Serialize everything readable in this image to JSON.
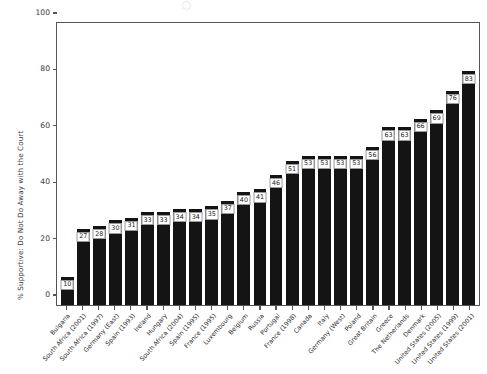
{
  "chart_data": {
    "type": "bar",
    "title": "",
    "subtitle": "",
    "xlabel": "",
    "ylabel": "% Supportive: Do Not Do Away with the Court",
    "ylim": [
      0,
      100
    ],
    "yticks": [
      0,
      20,
      40,
      60,
      80,
      100
    ],
    "grid": false,
    "legend": "none",
    "orientation": "vertical",
    "bar_color": "#141414",
    "value_labels_shown": true,
    "categories": [
      "Bulgaria",
      "South Africa (2001)",
      "South Africa (1997)",
      "Germany (East)",
      "Spain (1993)",
      "Ireland",
      "Hungary",
      "South Africa (2004)",
      "Spain (1995)",
      "France (1995)",
      "Luxembourg",
      "Belgium",
      "Russia",
      "Portugal",
      "France (1998)",
      "Canada",
      "Italy",
      "Germany (West)",
      "Poland",
      "Great Britain",
      "Greece",
      "The Netherlands",
      "Denmark",
      "United States (2005)",
      "United States (1999)",
      "United States (2001)"
    ],
    "values": [
      10,
      27,
      28,
      30,
      31,
      33,
      33,
      34,
      34,
      35,
      37,
      40,
      41,
      46,
      51,
      53,
      53,
      53,
      53,
      56,
      63,
      63,
      66,
      69,
      76,
      83
    ]
  },
  "colors": {
    "bar": "#141414",
    "axis": "#555555",
    "text": "#3a3a3a",
    "label_box_border": "#9a9a9a",
    "background": "#ffffff"
  }
}
